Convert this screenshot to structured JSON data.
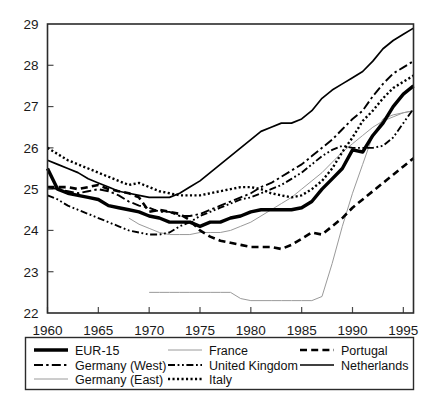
{
  "chart_data": {
    "type": "line",
    "title": "",
    "subtitle": "",
    "xlabel": "",
    "ylabel": "",
    "xlim": [
      1960,
      1996
    ],
    "ylim": [
      22,
      29
    ],
    "grid": false,
    "legend_position": "bottom",
    "xticks": [
      1960,
      1965,
      1970,
      1975,
      1980,
      1985,
      1990,
      1995
    ],
    "xtick_labels": [
      "1960",
      "1965",
      "1970",
      "1975",
      "1980",
      "1985",
      "1990",
      "1995"
    ],
    "yticks": [
      22,
      23,
      24,
      25,
      26,
      27,
      28,
      29
    ],
    "ytick_labels": [
      "22",
      "23",
      "24",
      "25",
      "26",
      "27",
      "28",
      "29"
    ],
    "series": [
      {
        "name": "EUR-15",
        "style": "solid-thick",
        "color": "#000000",
        "width": 3.4,
        "dash": "",
        "x": [
          1960,
          1961,
          1962,
          1963,
          1964,
          1965,
          1966,
          1967,
          1968,
          1969,
          1970,
          1971,
          1972,
          1973,
          1974,
          1975,
          1976,
          1977,
          1978,
          1979,
          1980,
          1981,
          1982,
          1983,
          1984,
          1985,
          1986,
          1987,
          1988,
          1989,
          1990,
          1991,
          1992,
          1993,
          1994,
          1995,
          1996
        ],
        "values": [
          25.5,
          25.0,
          24.9,
          24.85,
          24.8,
          24.75,
          24.6,
          24.55,
          24.5,
          24.45,
          24.35,
          24.3,
          24.2,
          24.2,
          24.2,
          24.1,
          24.2,
          24.2,
          24.3,
          24.35,
          24.45,
          24.5,
          24.5,
          24.5,
          24.5,
          24.55,
          24.7,
          25.0,
          25.25,
          25.5,
          25.95,
          25.9,
          26.3,
          26.6,
          27.0,
          27.3,
          27.5
        ]
      },
      {
        "name": "Germany (West)",
        "style": "dash-dot",
        "color": "#000000",
        "width": 1.9,
        "dash": "9,3.2,2.4,3.2",
        "x": [
          1960,
          1961,
          1962,
          1963,
          1964,
          1965,
          1966,
          1967,
          1968,
          1969,
          1970,
          1971,
          1972,
          1973,
          1974,
          1975,
          1976,
          1977,
          1978,
          1979,
          1980,
          1981,
          1982,
          1983,
          1984,
          1985,
          1986,
          1987,
          1988,
          1989,
          1990,
          1991,
          1992,
          1993,
          1994,
          1995,
          1996
        ],
        "values": [
          25.05,
          25.0,
          24.95,
          24.9,
          24.95,
          25.0,
          24.95,
          24.85,
          24.7,
          24.6,
          24.55,
          24.45,
          24.45,
          24.35,
          24.35,
          24.4,
          24.5,
          24.6,
          24.7,
          24.8,
          24.9,
          25.05,
          25.15,
          25.3,
          25.45,
          25.6,
          25.8,
          26.0,
          26.2,
          26.45,
          26.7,
          26.9,
          27.25,
          27.55,
          27.8,
          27.95,
          28.1
        ]
      },
      {
        "name": "Germany (East)",
        "style": "thin-grey",
        "color": "#9a9a9a",
        "width": 1.0,
        "dash": "",
        "x": [
          1970,
          1971,
          1972,
          1973,
          1974,
          1975,
          1976,
          1977,
          1978,
          1979,
          1980,
          1981,
          1982,
          1983,
          1984,
          1985,
          1986,
          1987,
          1988,
          1989,
          1990,
          1991,
          1992,
          1993,
          1994,
          1995,
          1996
        ],
        "values": [
          22.5,
          22.5,
          22.5,
          22.5,
          22.5,
          22.5,
          22.5,
          22.5,
          22.5,
          22.35,
          22.3,
          22.3,
          22.3,
          22.3,
          22.3,
          22.3,
          22.3,
          22.4,
          23.2,
          24.1,
          24.9,
          25.6,
          26.3,
          26.7,
          26.8,
          26.85,
          26.9
        ]
      },
      {
        "name": "France",
        "style": "thin-light",
        "color": "#9a9a9a",
        "width": 1.0,
        "dash": "",
        "x": [
          1968,
          1969,
          1970,
          1971,
          1972,
          1973,
          1974,
          1975,
          1976,
          1977,
          1978,
          1979,
          1980,
          1981,
          1982,
          1983,
          1984,
          1985,
          1986,
          1987,
          1988,
          1989,
          1990,
          1991,
          1992,
          1993,
          1994,
          1995,
          1996
        ],
        "values": [
          24.3,
          24.15,
          24.05,
          23.95,
          23.9,
          23.9,
          23.9,
          23.95,
          23.95,
          23.95,
          24.0,
          24.1,
          24.2,
          24.35,
          24.5,
          24.65,
          24.8,
          25.0,
          25.2,
          25.4,
          25.65,
          25.9,
          26.1,
          26.3,
          26.5,
          26.65,
          26.75,
          26.85,
          26.9
        ]
      },
      {
        "name": "United Kingdom",
        "style": "dash-dot-dot",
        "color": "#000000",
        "width": 1.9,
        "dash": "7,2.6,1.8,2.6,1.8,2.6",
        "x": [
          1960,
          1961,
          1962,
          1963,
          1964,
          1965,
          1966,
          1967,
          1968,
          1969,
          1970,
          1971,
          1972,
          1973,
          1974,
          1975,
          1976,
          1977,
          1978,
          1979,
          1980,
          1981,
          1982,
          1983,
          1984,
          1985,
          1986,
          1987,
          1988,
          1989,
          1990,
          1991,
          1992,
          1993,
          1994,
          1995,
          1996
        ],
        "values": [
          24.85,
          24.75,
          24.6,
          24.5,
          24.4,
          24.3,
          24.2,
          24.1,
          24.0,
          23.95,
          23.9,
          23.9,
          23.95,
          24.1,
          24.2,
          24.35,
          24.45,
          24.55,
          24.65,
          24.75,
          24.8,
          24.9,
          25.0,
          25.1,
          25.25,
          25.4,
          25.6,
          25.8,
          25.95,
          26.05,
          26.0,
          26.0,
          26.0,
          26.05,
          26.25,
          26.6,
          26.95
        ]
      },
      {
        "name": "Italy",
        "style": "dotted",
        "color": "#000000",
        "width": 2.4,
        "dash": "2.1,2.4",
        "x": [
          1960,
          1961,
          1962,
          1963,
          1964,
          1965,
          1966,
          1967,
          1968,
          1969,
          1970,
          1971,
          1972,
          1973,
          1974,
          1975,
          1976,
          1977,
          1978,
          1979,
          1980,
          1981,
          1982,
          1983,
          1984,
          1985,
          1986,
          1987,
          1988,
          1989,
          1990,
          1991,
          1992,
          1993,
          1994,
          1995,
          1996
        ],
        "values": [
          26.0,
          25.85,
          25.7,
          25.6,
          25.5,
          25.4,
          25.3,
          25.2,
          25.1,
          25.15,
          25.05,
          24.95,
          24.9,
          24.85,
          24.85,
          24.85,
          24.9,
          24.95,
          25.0,
          25.05,
          25.05,
          25.0,
          24.9,
          24.85,
          24.8,
          24.85,
          25.0,
          25.2,
          25.5,
          25.9,
          26.25,
          26.65,
          26.9,
          27.2,
          27.45,
          27.6,
          27.75
        ]
      },
      {
        "name": "Portugal",
        "style": "dashed",
        "color": "#000000",
        "width": 2.6,
        "dash": "7,4.2",
        "x": [
          1960,
          1961,
          1962,
          1963,
          1964,
          1965,
          1966,
          1967,
          1968,
          1969,
          1970,
          1971,
          1972,
          1973,
          1974,
          1975,
          1976,
          1977,
          1978,
          1979,
          1980,
          1981,
          1982,
          1983,
          1984,
          1985,
          1986,
          1987,
          1988,
          1989,
          1990,
          1991,
          1992,
          1993,
          1994,
          1995,
          1996
        ],
        "values": [
          25.05,
          25.05,
          25.05,
          25.0,
          25.05,
          25.1,
          25.0,
          24.95,
          24.9,
          24.8,
          24.45,
          24.5,
          24.45,
          24.4,
          24.25,
          24.0,
          23.85,
          23.75,
          23.7,
          23.65,
          23.6,
          23.6,
          23.6,
          23.55,
          23.65,
          23.8,
          23.95,
          23.9,
          24.1,
          24.3,
          24.55,
          24.75,
          24.95,
          25.15,
          25.35,
          25.55,
          25.75
        ]
      },
      {
        "name": "Netherlands",
        "style": "solid",
        "color": "#000000",
        "width": 1.7,
        "dash": "",
        "x": [
          1960,
          1961,
          1962,
          1963,
          1964,
          1965,
          1966,
          1967,
          1968,
          1969,
          1970,
          1971,
          1972,
          1973,
          1974,
          1975,
          1976,
          1977,
          1978,
          1979,
          1980,
          1981,
          1982,
          1983,
          1984,
          1985,
          1986,
          1987,
          1988,
          1989,
          1990,
          1991,
          1992,
          1993,
          1994,
          1995,
          1996
        ],
        "values": [
          25.7,
          25.6,
          25.5,
          25.4,
          25.25,
          25.15,
          25.05,
          24.95,
          24.9,
          24.85,
          24.8,
          24.8,
          24.8,
          24.9,
          25.05,
          25.2,
          25.4,
          25.6,
          25.8,
          26.0,
          26.2,
          26.4,
          26.5,
          26.6,
          26.6,
          26.7,
          26.9,
          27.2,
          27.4,
          27.55,
          27.7,
          27.85,
          28.1,
          28.4,
          28.6,
          28.75,
          28.9
        ]
      }
    ],
    "legend": {
      "columns": [
        [
          {
            "label": "EUR-15",
            "style": "solid-thick"
          },
          {
            "label": "Germany (West)",
            "style": "dash-dot"
          },
          {
            "label": "Germany (East)",
            "style": "thin-grey"
          }
        ],
        [
          {
            "label": "France",
            "style": "thin-light"
          },
          {
            "label": "United Kingdom",
            "style": "dash-dot-dot"
          },
          {
            "label": "Italy",
            "style": "dotted"
          }
        ],
        [
          {
            "label": "Portugal",
            "style": "dashed"
          },
          {
            "label": "Netherlands",
            "style": "solid"
          }
        ]
      ]
    }
  }
}
